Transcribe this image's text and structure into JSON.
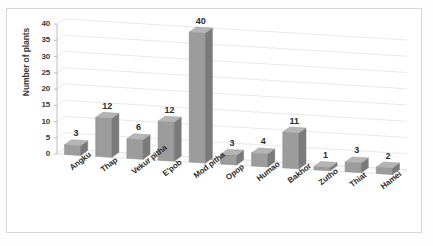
{
  "chart_data": {
    "type": "bar",
    "title": "",
    "subtitle": "",
    "xlabel": "",
    "ylabel": "Number of plants",
    "ylim": [
      0,
      40
    ],
    "ytick_step": 5,
    "yticks": [
      "0",
      "5",
      "10",
      "15",
      "20",
      "25",
      "30",
      "35",
      "40"
    ],
    "grid": true,
    "legend": "none",
    "three_d": true,
    "categories": [
      "Angku",
      "Thap",
      "Vekur pitha",
      "E'pob",
      "Mod pitha",
      "Opop",
      "Humao",
      "Bakhor",
      "Zutho",
      "Thiat",
      "Hamei"
    ],
    "values": [
      3,
      12,
      6,
      12,
      40,
      3,
      4,
      11,
      1,
      3,
      2
    ],
    "data_labels": [
      "3",
      "12",
      "6",
      "12",
      "40",
      "3",
      "4",
      "11",
      "1",
      "3",
      "2"
    ],
    "colors": {
      "bar_face": "#9c9c9c",
      "bar_side": "#7a7a7a",
      "bar_top": "#b5b5b5",
      "grid": "#e2e2e2",
      "axis": "#bdbdbd",
      "text": "#2b2b2b",
      "plot_bg": "#ffffff",
      "frame": "#d8d8d8"
    }
  }
}
